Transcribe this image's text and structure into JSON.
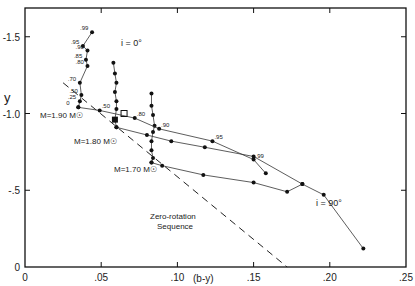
{
  "chart_data": {
    "type": "line",
    "title": "",
    "xlabel": "(b-y)",
    "ylabel": "y",
    "xlim": [
      0,
      0.25
    ],
    "ylim": [
      0,
      -1.7
    ],
    "x_ticks": [
      "0",
      ".05",
      ".10",
      ".15",
      ".20",
      ".25"
    ],
    "y_ticks": [
      "0",
      "-.5",
      "-1.0",
      "-1.5"
    ],
    "grid": false,
    "annotations": {
      "i0": "i = 0°",
      "i90": "i = 90°",
      "m190": "M=1.90 M☉",
      "m180": "M=1.80 M☉",
      "m170": "M=1.70 M☉",
      "zrs1": "Zero-rotation",
      "zrs2": "Sequence"
    },
    "series": [
      {
        "name": "M=1.90 i=0°",
        "points": [
          [
            0.035,
            -1.04
          ],
          [
            0.036,
            -1.08
          ],
          [
            0.037,
            -1.12
          ],
          [
            0.036,
            -1.2
          ],
          [
            0.041,
            -1.31
          ],
          [
            0.04,
            -1.35
          ],
          [
            0.041,
            -1.41
          ],
          [
            0.038,
            -1.44
          ],
          [
            0.044,
            -1.53
          ]
        ],
        "labels": [
          "0",
          ".25",
          ".50",
          ".70",
          ".80",
          ".85",
          ".90",
          ".95",
          ".99"
        ]
      },
      {
        "name": "M=1.80 i=0°",
        "points": [
          [
            0.06,
            -0.91
          ],
          [
            0.059,
            -0.96
          ],
          [
            0.06,
            -1.03
          ],
          [
            0.06,
            -1.08
          ],
          [
            0.059,
            -1.14
          ],
          [
            0.06,
            -1.2
          ],
          [
            0.059,
            -1.26
          ],
          [
            0.058,
            -1.33
          ]
        ]
      },
      {
        "name": "M=1.70 i=0°",
        "points": [
          [
            0.083,
            -0.68
          ],
          [
            0.084,
            -0.71
          ],
          [
            0.083,
            -0.76
          ],
          [
            0.083,
            -0.82
          ],
          [
            0.084,
            -0.88
          ],
          [
            0.085,
            -0.92
          ],
          [
            0.084,
            -0.99
          ],
          [
            0.083,
            -1.05
          ],
          [
            0.083,
            -1.13
          ]
        ]
      },
      {
        "name": "M=1.90 inclined",
        "points": [
          [
            0.035,
            -1.04
          ],
          [
            0.049,
            -1.02
          ],
          [
            0.072,
            -0.97
          ],
          [
            0.088,
            -0.9
          ],
          [
            0.123,
            -0.82
          ],
          [
            0.15,
            -0.7
          ],
          [
            0.158,
            -0.61
          ]
        ],
        "labels": [
          "",
          ".50",
          ".80",
          ".90",
          ".95",
          ".99",
          ""
        ]
      },
      {
        "name": "M=1.80 inclined",
        "points": [
          [
            0.06,
            -0.91
          ],
          [
            0.08,
            -0.86
          ],
          [
            0.096,
            -0.82
          ],
          [
            0.118,
            -0.78
          ],
          [
            0.15,
            -0.72
          ],
          [
            0.182,
            -0.54
          ]
        ]
      },
      {
        "name": "M=1.70 i=90°",
        "points": [
          [
            0.083,
            -0.68
          ],
          [
            0.09,
            -0.66
          ],
          [
            0.117,
            -0.6
          ],
          [
            0.15,
            -0.55
          ],
          [
            0.172,
            -0.49
          ],
          [
            0.182,
            -0.54
          ],
          [
            0.196,
            -0.47
          ],
          [
            0.222,
            -0.12
          ]
        ]
      }
    ],
    "zero_rotation_sequence": [
      [
        0.025,
        -1.2
      ],
      [
        0.172,
        0.0
      ]
    ],
    "markers": {
      "filled_square": [
        0.059,
        -0.96
      ],
      "open_square": [
        0.065,
        -1.0
      ]
    }
  }
}
